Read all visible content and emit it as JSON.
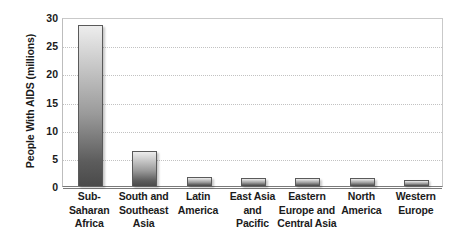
{
  "chart_data": {
    "type": "bar",
    "title": "",
    "xlabel": "",
    "ylabel": "People With AIDS (millions)",
    "ylim": [
      0,
      30
    ],
    "yticks": [
      0,
      5,
      10,
      15,
      20,
      25,
      30
    ],
    "ytick_labels": [
      "0",
      "5",
      "10",
      "15",
      "20",
      "25",
      "30"
    ],
    "grid": true,
    "legend": "none",
    "categories": [
      "Sub-Saharan Africa",
      "South and Southeast Asia",
      "Latin America",
      "East Asia and Pacific",
      "Eastern Europe and Central Asia",
      "North America",
      "Western Europe"
    ],
    "category_lines": [
      [
        "Sub-Saharan",
        "Africa"
      ],
      [
        "South and",
        "Southeast",
        "Asia"
      ],
      [
        "Latin",
        "America"
      ],
      [
        "East Asia",
        "and",
        "Pacific"
      ],
      [
        "Eastern",
        "Europe and",
        "Central Asia"
      ],
      [
        "North",
        "America"
      ],
      [
        "Western",
        "Europe"
      ]
    ],
    "values": [
      28.5,
      6.2,
      1.6,
      1.5,
      1.5,
      1.5,
      1.0
    ],
    "bar_fill_top": "#ededed",
    "bar_fill_bottom": "#4a4a4a",
    "bar_border": "#5a5a5a",
    "gridline_color": "#c2c2c2",
    "axis_color": "#7a7a7a",
    "text_color": "#1b1b1b"
  }
}
